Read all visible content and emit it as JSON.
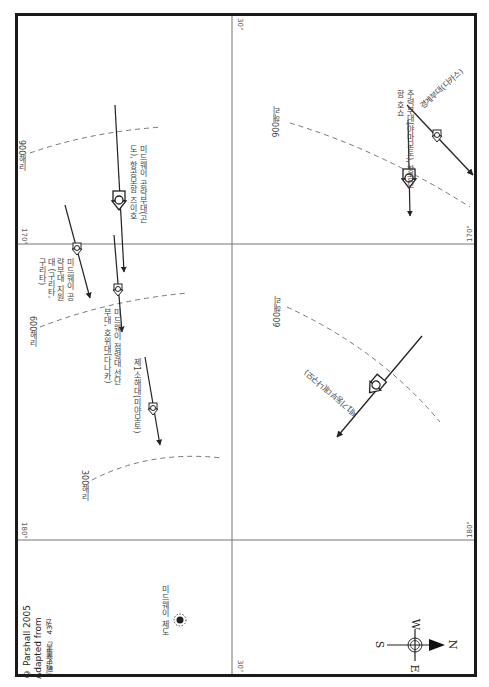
{
  "map": {
    "orientation": "rotated 90 degrees clockwise (north points right)",
    "grid": {
      "latitude_label": "30°",
      "longitude_labels": [
        "170°",
        "180°"
      ]
    },
    "range_rings": [
      {
        "label": "900해리",
        "position": "upper-left"
      },
      {
        "label": "900해리",
        "position": "upper-right"
      },
      {
        "label": "600해리",
        "position": "left-middle"
      },
      {
        "label": "600해리",
        "position": "right-middle"
      },
      {
        "label": "300해리",
        "position": "left-lower"
      }
    ],
    "forces": [
      {
        "label": "경계부대(다카스)",
        "icon": "ship-formation-icon"
      },
      {
        "label": "주력부대(야마모토), 항공모함 호쇼",
        "icon": "carrier-formation-icon"
      },
      {
        "label": "미드웨이 공략부대(곤도), 항공모함 즈이호",
        "icon": "carrier-formation-icon"
      },
      {
        "label": "미드웨이 공략부대 지원대 (구리타, 구리타)",
        "icon": "ship-formation-icon"
      },
      {
        "label": "미드웨이 점령대 선단부대, 호위대(다나카)",
        "icon": "ship-formation-icon"
      },
      {
        "label": "제1소해대(미야모토)",
        "icon": "ship-formation-icon"
      },
      {
        "label": "제1기동부대(나구모)",
        "icon": "carrier-formation-icon"
      }
    ],
    "landmark": {
      "label": "미드웨이 제도",
      "icon": "island-icon"
    },
    "compass": {
      "N": "N",
      "S": "S",
      "E": "E",
      "W": "W"
    },
    "credit": {
      "line1": "© Parshall 2005",
      "line2": "Adapted from",
      "line3": "『戰史叢書』 43권"
    }
  }
}
